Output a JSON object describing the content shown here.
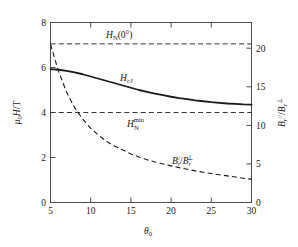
{
  "chart_data": {
    "type": "line",
    "title": "",
    "xlabel": "θ₀",
    "ylabel": "μ₀H/T",
    "y2label": "Bᵣ∥/Bᵣ⊥",
    "xlim": [
      5,
      30
    ],
    "ylim": [
      0,
      8
    ],
    "y2lim": [
      0,
      23.33
    ],
    "grid": false,
    "legend_position": "inline-annotations",
    "xticks": [
      5,
      10,
      15,
      20,
      25,
      30
    ],
    "xticklabels": [
      "5",
      "10",
      "15",
      "20",
      "25",
      "30"
    ],
    "yticks": [
      0,
      2,
      4,
      6,
      8
    ],
    "yticklabels": [
      "0",
      "2",
      "4",
      "6",
      "8"
    ],
    "y2ticks": [
      0,
      5,
      10,
      15,
      20
    ],
    "y2ticklabels": [
      "0",
      "5",
      "10",
      "15",
      "20"
    ],
    "series": [
      {
        "name": "H_cJ",
        "label": "HcJ",
        "style": "solid",
        "axis": "left",
        "x": [
          5,
          6,
          7,
          8,
          9,
          10,
          11,
          12,
          13,
          14,
          15,
          16,
          17,
          18,
          19,
          20,
          21,
          22,
          23,
          24,
          25,
          26,
          27,
          28,
          29,
          30
        ],
        "values": [
          5.93,
          5.9,
          5.85,
          5.78,
          5.7,
          5.6,
          5.5,
          5.4,
          5.3,
          5.2,
          5.1,
          5.0,
          4.92,
          4.84,
          4.77,
          4.7,
          4.64,
          4.59,
          4.54,
          4.5,
          4.46,
          4.43,
          4.4,
          4.38,
          4.36,
          4.35
        ]
      },
      {
        "name": "Br_ratio",
        "label": "Br_par_over_Br_perp",
        "style": "dashed",
        "axis": "right",
        "x": [
          5,
          6,
          7,
          8,
          9,
          10,
          11,
          12,
          13,
          14,
          15,
          16,
          17,
          18,
          19,
          20,
          21,
          22,
          23,
          24,
          25,
          26,
          27,
          28,
          29,
          30
        ],
        "values": [
          20.5,
          17.0,
          14.3,
          12.3,
          10.8,
          9.6,
          8.7,
          7.9,
          7.3,
          6.8,
          6.3,
          5.9,
          5.55,
          5.25,
          5.0,
          4.75,
          4.52,
          4.3,
          4.1,
          3.92,
          3.75,
          3.6,
          3.45,
          3.3,
          3.15,
          3.0
        ]
      }
    ],
    "hlines": [
      {
        "name": "H_N(0deg)",
        "value": 7.05,
        "axis": "left",
        "style": "dashed"
      },
      {
        "name": "H_N_min",
        "value": 4.0,
        "axis": "left",
        "style": "dashed"
      }
    ],
    "annotations": [
      {
        "name": "hn-zero-label",
        "text_main": "H",
        "text_sub": "N",
        "text_tail": "(0°)",
        "x": 0.33,
        "y": 6.5
      },
      {
        "name": "hcj-label",
        "text_main": "H",
        "text_sub": "cJ",
        "x": 0.43,
        "y": 5.45
      },
      {
        "name": "hn-min-label",
        "text_main": "H",
        "text_sub": "N",
        "text_sup": "min",
        "x": 0.43,
        "y": 3.4
      },
      {
        "name": "br-ratio-label",
        "text_main": "B",
        "text_sub": "r",
        "text_sup": "//",
        "x": 0.63,
        "y": 2.35
      }
    ]
  },
  "labels": {
    "y_left_mu": "μ",
    "y_left_zero": "0",
    "y_left_h": "H",
    "y_left_slash_t": "/T",
    "y_right_b": "B",
    "y_right_r": "r",
    "y_right_par": "//",
    "y_right_slash": "/",
    "y_right_b2": "B",
    "y_right_r2": "r",
    "y_right_perp": "⊥",
    "x_theta": "θ",
    "x_zero": "0",
    "hn_zero_h": "H",
    "hn_zero_n": "N",
    "hn_zero_tail": "(0°)",
    "hcj_h": "H",
    "hcj_sub": "cJ",
    "hnmin_h": "H",
    "hnmin_n": "N",
    "hnmin_sup": "min",
    "br_b1": "B",
    "br_r1": "r",
    "br_par": "//",
    "br_slash": "/",
    "br_b2": "B",
    "br_r2": "r",
    "br_perp": "⊥",
    "xt0": "5",
    "xt1": "10",
    "xt2": "15",
    "xt3": "20",
    "xt4": "25",
    "xt5": "30",
    "yt0": "0",
    "yt1": "2",
    "yt2": "4",
    "yt3": "6",
    "yt4": "8",
    "y2t0": "0",
    "y2t1": "5",
    "y2t2": "10",
    "y2t3": "15",
    "y2t4": "20"
  },
  "colors": {
    "axis": "#4d4d4d",
    "curve": "#1a1a1a",
    "background": "#ffffff"
  }
}
